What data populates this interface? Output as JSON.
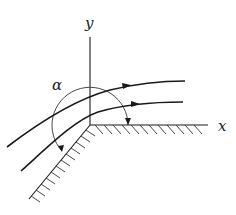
{
  "diagram": {
    "labels": {
      "y_axis": "y",
      "x_axis": "x",
      "angle": "α"
    },
    "colors": {
      "stroke": "#1a1a1a",
      "background": "#ffffff"
    },
    "elements": {
      "axes": [
        "x-axis (wall, hatched below)",
        "y-axis"
      ],
      "wall": "lower-left inclined wall, hatched",
      "streamlines": 2,
      "angle_arc": "arc from x-axis sweeping counterclockwise to inclined wall, marking α"
    }
  }
}
